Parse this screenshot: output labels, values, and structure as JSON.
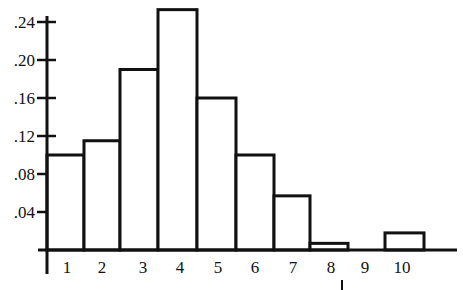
{
  "chart_data": {
    "type": "bar",
    "subtype": "histogram",
    "title": "",
    "xlabel": "",
    "ylabel": "",
    "categories": [
      "1",
      "2",
      "3",
      "4",
      "5",
      "6",
      "7",
      "8",
      "9",
      "10"
    ],
    "values": [
      0.1,
      0.115,
      0.19,
      0.253,
      0.16,
      0.1,
      0.057,
      0.007,
      0.0,
      0.018
    ],
    "y_ticks": [
      ".04",
      ".08",
      ".12",
      ".16",
      ".20",
      ".24"
    ],
    "y_tick_values": [
      0.04,
      0.08,
      0.12,
      0.16,
      0.2,
      0.24
    ],
    "ylim": [
      0,
      0.26
    ],
    "grid": false,
    "legend": null,
    "bar_fill": "#ffffff",
    "bar_stroke": "#111111"
  }
}
